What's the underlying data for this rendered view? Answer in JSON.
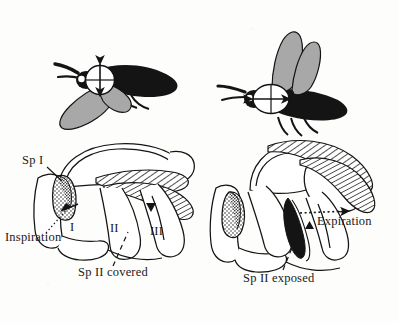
{
  "figure": {
    "background_color": "#fdfdfb",
    "ink_color": "#111111",
    "wing_fill_color": "#a8a8a8",
    "body_fill_color": "#141414"
  },
  "panels": {
    "top_left": {
      "name": "moth-wings-down",
      "phase": "inspiration",
      "wing_position": "down",
      "marker": "circle-with-vertical-double-arrow",
      "marker_shape": "circle",
      "marker_axis": "vertical"
    },
    "top_right": {
      "name": "moth-wings-up",
      "phase": "expiration",
      "wing_position": "up",
      "marker": "ellipse-with-horizontal-double-arrow",
      "marker_shape": "ellipse-wide",
      "marker_axis": "horizontal"
    },
    "bottom_left": {
      "name": "thorax-inspiration",
      "labels": {
        "spiracle_one": "Sp I",
        "airflow": "Inspiration",
        "spiracle_two": "Sp II covered",
        "segment_one": "I",
        "segment_two": "II",
        "segment_three": "III"
      },
      "spiracle_one_state": "open-stippled",
      "spiracle_two_state": "covered",
      "airflow_direction": "inward",
      "arrow_marker": "down-triangle"
    },
    "bottom_right": {
      "name": "thorax-expiration",
      "labels": {
        "airflow": "Expiration",
        "spiracle_two": "Sp II exposed"
      },
      "spiracle_one_state": "stippled",
      "spiracle_two_state": "exposed-black",
      "airflow_direction": "outward",
      "arrow_marker": "up-triangle"
    }
  }
}
